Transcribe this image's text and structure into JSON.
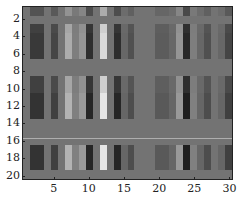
{
  "chart_data": {
    "type": "heatmap",
    "title": "",
    "xlabel": "",
    "ylabel": "",
    "colormap": "gray",
    "n_rows": 20,
    "n_cols": 30,
    "xlim": [
      0.5,
      30.5
    ],
    "ylim": [
      20.5,
      0.5
    ],
    "x_ticks": [
      5,
      10,
      15,
      20,
      25,
      30
    ],
    "x_tick_labels": [
      "5",
      "10",
      "15",
      "20",
      "25",
      "30"
    ],
    "y_ticks": [
      2,
      4,
      6,
      8,
      10,
      12,
      14,
      16,
      18,
      20
    ],
    "y_tick_labels": [
      "2",
      "4",
      "6",
      "8",
      "10",
      "12",
      "14",
      "16",
      "18",
      "20"
    ],
    "baseline_gray": 0.45,
    "column_profile": [
      0.45,
      0.2,
      0.2,
      0.45,
      0.25,
      0.45,
      0.7,
      0.5,
      0.6,
      0.15,
      0.45,
      0.9,
      0.45,
      0.15,
      0.4,
      0.3,
      0.45,
      0.45,
      0.45,
      0.35,
      0.35,
      0.4,
      0.6,
      0.12,
      0.5,
      0.4,
      0.3,
      0.45,
      0.4,
      0.25
    ],
    "row_strength": [
      0.5,
      0.0,
      0.8,
      0.9,
      0.9,
      0.9,
      0.0,
      0.0,
      0.8,
      0.8,
      1.0,
      1.0,
      1.0,
      0.0,
      0.0,
      0.0,
      1.0,
      1.0,
      1.0,
      0.0
    ],
    "uniform_rows": [
      2,
      7,
      8,
      14,
      15,
      16,
      20
    ],
    "annotations": [
      {
        "type": "horizontal-line",
        "y": 15.6,
        "color": "#b8b8b8"
      }
    ],
    "grid": false,
    "legend": null
  }
}
